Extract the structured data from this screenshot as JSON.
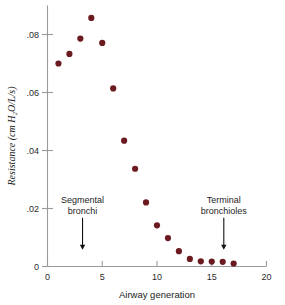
{
  "figure": {
    "background": "#ffffff",
    "marker_color": "#6b1a20",
    "axis_color": "#9a9a9a",
    "text_color": "#1c1c1c"
  },
  "chart_data": {
    "type": "scatter",
    "title": "",
    "xlabel": "Airway generation",
    "ylabel": "Resistance (cm H₂O/L/s)",
    "ylabel_plain": "Resistance (cm H2O/L/s)",
    "xlim": [
      0,
      20
    ],
    "ylim": [
      0,
      0.092
    ],
    "grid": false,
    "legend": "none",
    "xticks": [
      0,
      5,
      10,
      15,
      20
    ],
    "xticklabels": [
      "0",
      "5",
      "10",
      "15",
      "20"
    ],
    "yticks": [
      0,
      0.02,
      0.04,
      0.06,
      0.08
    ],
    "yticklabels": [
      "0",
      ".02",
      ".04",
      ".06",
      ".08"
    ],
    "series": [
      {
        "name": "Airway resistance",
        "marker": "circle",
        "color": "#6b1a20",
        "x": [
          1,
          2,
          3,
          4,
          5,
          6,
          7,
          8,
          9,
          10,
          11,
          12,
          13,
          14,
          15,
          16,
          17
        ],
        "y": [
          0.07,
          0.0733,
          0.0786,
          0.0857,
          0.0771,
          0.0614,
          0.0434,
          0.0337,
          0.0221,
          0.0142,
          0.0098,
          0.0053,
          0.0026,
          0.0018,
          0.0017,
          0.0016,
          0.001
        ]
      }
    ],
    "annotations": [
      {
        "name": "segmental-bronchi",
        "lines": [
          "Segmental",
          "bronchi"
        ],
        "x": 3.2,
        "text_y": 0.0218,
        "arrow_from_y": 0.0168,
        "arrow_to_y": 0.0058
      },
      {
        "name": "terminal-bronchioles",
        "lines": [
          "Terminal",
          "bronchioles"
        ],
        "x": 16.1,
        "text_y": 0.0218,
        "arrow_from_y": 0.0168,
        "arrow_to_y": 0.0058
      }
    ]
  }
}
